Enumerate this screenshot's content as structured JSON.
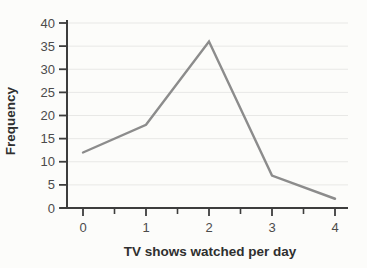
{
  "chart_data": {
    "type": "line",
    "title": "",
    "xlabel": "TV shows watched per day",
    "ylabel": "Frequency",
    "x": [
      0,
      1,
      2,
      3,
      4
    ],
    "series": [
      {
        "name": "frequency-polygon",
        "values": [
          12,
          18,
          36,
          7,
          2
        ]
      }
    ],
    "xlim": [
      0,
      4
    ],
    "ylim": [
      0,
      40
    ],
    "y_ticks": [
      0,
      5,
      10,
      15,
      20,
      25,
      30,
      35,
      40
    ],
    "x_major_ticks": [
      0,
      1,
      2,
      3,
      4
    ],
    "x_minor_ticks": [
      0.5,
      1.5,
      2.5,
      3.5
    ],
    "grid": "horizontal-only",
    "legend": "none",
    "colors": {
      "line": "#8c8c8c",
      "axis": "#3d3d3d",
      "grid": "#e8e8e6",
      "tick_label": "#4b4b4b",
      "axis_title": "#2f2f2f",
      "background": "#fcfcfa"
    }
  }
}
